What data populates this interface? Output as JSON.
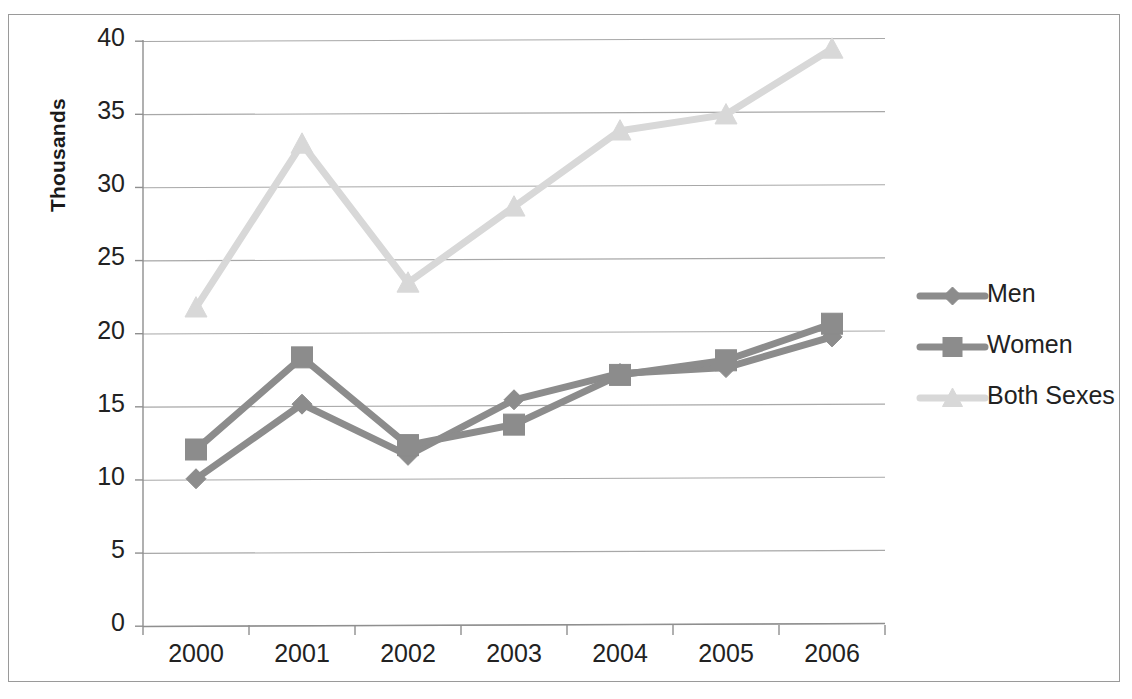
{
  "chart_data": {
    "type": "line",
    "title": "",
    "subtitle": "",
    "xlabel": "",
    "ylabel": "Thousands",
    "categories": [
      "2000",
      "2001",
      "2002",
      "2003",
      "2004",
      "2005",
      "2006"
    ],
    "series": [
      {
        "name": "Men",
        "marker": "diamond",
        "color": "#8c8c8c",
        "values": [
          10.0,
          15.1,
          11.6,
          15.4,
          17.2,
          17.6,
          19.7
        ]
      },
      {
        "name": "Women",
        "marker": "square",
        "color": "#8c8c8c",
        "values": [
          12.0,
          18.3,
          12.3,
          13.7,
          17.1,
          18.1,
          20.6
        ]
      },
      {
        "name": "Both Sexes",
        "marker": "triangle",
        "color": "#d8d8d8",
        "values": [
          21.7,
          32.9,
          23.4,
          28.6,
          33.8,
          34.9,
          39.4
        ]
      }
    ],
    "yticks": [
      "0",
      "5",
      "10",
      "15",
      "20",
      "25",
      "30",
      "35",
      "40"
    ],
    "ylim": [
      0,
      40
    ],
    "grid": "horizontal",
    "legend_position": "right",
    "gridline_color": "#a8a8a8",
    "axis_color": "#8f8f8f",
    "plot_background": "#ffffff"
  },
  "legend": {
    "items": [
      {
        "label": "Men"
      },
      {
        "label": "Women"
      },
      {
        "label": "Both Sexes"
      }
    ]
  }
}
